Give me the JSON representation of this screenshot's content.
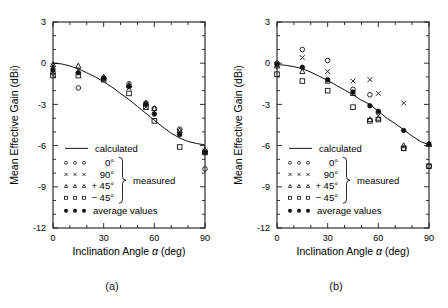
{
  "figure": {
    "panels": [
      {
        "id": "a",
        "caption": "(a)"
      },
      {
        "id": "b",
        "caption": "(b)"
      }
    ]
  },
  "axes": {
    "ylabel": "Mean Effective Gain  (dBi)",
    "xlabel_parts": {
      "main": "Inclination Angle",
      "symbol": "α",
      "unit": "(deg)"
    },
    "xlabel": "Inclination Angle α  (deg)",
    "yticks": [
      "3",
      "0",
      "-3",
      "-6",
      "-9",
      "-12"
    ],
    "xticks": [
      "0",
      "30",
      "60",
      "90"
    ]
  },
  "legend": {
    "calculated": "calculated",
    "series_0": "0°",
    "series_90": "90°",
    "series_p45": "+ 45°",
    "series_m45": "− 45°",
    "measured": "measured",
    "average": "average  values"
  },
  "chart_data": [
    {
      "type": "scatter",
      "panel": "a",
      "title": "(a)",
      "xlabel": "Inclination Angle α (deg)",
      "ylabel": "Mean Effective Gain (dBi)",
      "xlim": [
        0,
        90
      ],
      "ylim": [
        -12,
        3
      ],
      "xticks": [
        0,
        30,
        60,
        90
      ],
      "yticks": [
        3,
        0,
        -3,
        -6,
        -9,
        -12
      ],
      "xminor_step": 10,
      "yminor_step": 1,
      "grid": false,
      "legend_position": "lower-left-inside",
      "series": [
        {
          "name": "calculated",
          "marker": "line",
          "x": [
            0,
            5,
            10,
            15,
            20,
            25,
            30,
            35,
            40,
            45,
            50,
            55,
            60,
            65,
            70,
            75,
            80,
            85,
            90
          ],
          "y": [
            0.0,
            -0.05,
            -0.2,
            -0.4,
            -0.7,
            -1.0,
            -1.35,
            -1.75,
            -2.2,
            -2.65,
            -3.15,
            -3.65,
            -4.15,
            -4.65,
            -5.1,
            -5.45,
            -5.7,
            -5.85,
            -5.95
          ]
        },
        {
          "name": "0°",
          "marker": "open-circle",
          "x": [
            0,
            15,
            30,
            45,
            55,
            60,
            75,
            90
          ],
          "y": [
            -0.7,
            -1.8,
            -1.1,
            -1.5,
            -2.9,
            -3.3,
            -4.8,
            -7.7
          ]
        },
        {
          "name": "90°",
          "marker": "cross",
          "x": [
            0,
            15,
            30,
            45,
            55,
            60,
            75,
            90
          ],
          "y": [
            -0.2,
            -0.5,
            -1.1,
            -1.8,
            -3.2,
            -3.5,
            -5.0,
            -6.4
          ]
        },
        {
          "name": "+ 45°",
          "marker": "open-triangle",
          "x": [
            0,
            15,
            30,
            45,
            55,
            60,
            75,
            90
          ],
          "y": [
            -0.1,
            -0.2,
            -1.0,
            -1.6,
            -2.9,
            -3.3,
            -4.9,
            -6.3
          ]
        },
        {
          "name": "− 45°",
          "marker": "open-square",
          "x": [
            0,
            15,
            30,
            45,
            55,
            60,
            75,
            90
          ],
          "y": [
            -0.9,
            -0.9,
            -1.2,
            -2.2,
            -3.2,
            -4.2,
            -6.1,
            -6.5
          ]
        },
        {
          "name": "average values",
          "marker": "filled-circle",
          "x": [
            0,
            15,
            30,
            45,
            55,
            60,
            75,
            90
          ],
          "y": [
            -0.5,
            -0.7,
            -1.1,
            -1.7,
            -3.0,
            -3.7,
            -5.2,
            -6.5
          ]
        }
      ]
    },
    {
      "type": "scatter",
      "panel": "b",
      "title": "(b)",
      "xlabel": "Inclination Angle α (deg)",
      "ylabel": "Mean Effective Gain (dBi)",
      "xlim": [
        0,
        90
      ],
      "ylim": [
        -12,
        3
      ],
      "xticks": [
        0,
        30,
        60,
        90
      ],
      "yticks": [
        3,
        0,
        -3,
        -6,
        -9,
        -12
      ],
      "xminor_step": 10,
      "yminor_step": 1,
      "grid": false,
      "legend_position": "lower-left-inside",
      "series": [
        {
          "name": "calculated",
          "marker": "line",
          "x": [
            0,
            5,
            10,
            15,
            20,
            25,
            30,
            35,
            40,
            45,
            50,
            55,
            60,
            65,
            70,
            75,
            80,
            85,
            90
          ],
          "y": [
            -0.1,
            -0.15,
            -0.25,
            -0.4,
            -0.65,
            -0.95,
            -1.25,
            -1.6,
            -1.95,
            -2.3,
            -2.7,
            -3.0,
            -3.5,
            -4.0,
            -4.4,
            -4.85,
            -5.3,
            -5.7,
            -5.95
          ]
        },
        {
          "name": "0°",
          "marker": "open-circle",
          "x": [
            0,
            15,
            30,
            45,
            55,
            60,
            75,
            90
          ],
          "y": [
            0.0,
            1.0,
            0.2,
            -1.9,
            -2.3,
            -3.6,
            -6.2,
            -7.5
          ]
        },
        {
          "name": "90°",
          "marker": "cross",
          "x": [
            0,
            15,
            30,
            45,
            55,
            60,
            75,
            90
          ],
          "y": [
            -0.1,
            0.4,
            -0.6,
            -1.3,
            -1.2,
            -2.2,
            -2.9,
            -5.9
          ]
        },
        {
          "name": "+ 45°",
          "marker": "open-triangle",
          "x": [
            0,
            15,
            30,
            45,
            55,
            60,
            75,
            90
          ],
          "y": [
            -0.2,
            -0.6,
            -1.3,
            -2.2,
            -4.1,
            -4.0,
            -6.0,
            -5.9
          ]
        },
        {
          "name": "− 45°",
          "marker": "open-square",
          "x": [
            0,
            15,
            30,
            45,
            55,
            60,
            75,
            90
          ],
          "y": [
            -0.8,
            -1.3,
            -2.0,
            -3.2,
            -4.2,
            -4.1,
            -6.2,
            -7.5
          ]
        },
        {
          "name": "average values",
          "marker": "filled-circle",
          "x": [
            0,
            15,
            30,
            45,
            55,
            60,
            75,
            90
          ],
          "y": [
            -0.1,
            -0.3,
            -1.2,
            -2.1,
            -3.1,
            -3.5,
            -4.9,
            -5.9
          ]
        }
      ]
    }
  ]
}
